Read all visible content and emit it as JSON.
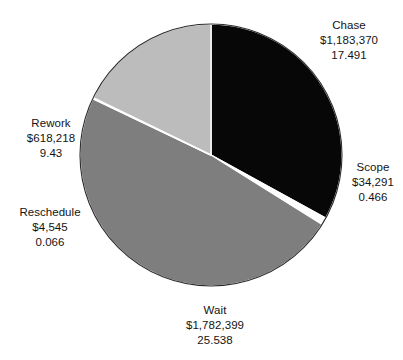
{
  "chart_data": {
    "type": "pie",
    "title": "",
    "subtitle": "",
    "xlabel": "",
    "ylabel": "",
    "legend_position": "none",
    "grid": false,
    "label_format": "name / currency amount / percent value",
    "start_angle_deg": 0,
    "direction": "clockwise",
    "center": {
      "x": 211,
      "y": 155
    },
    "radius": 131,
    "total_value": 3622823,
    "total_percent": 52.991,
    "categories": [
      "Chase",
      "Scope",
      "Wait",
      "Reschedule",
      "Rework"
    ],
    "values": [
      1183370,
      34291,
      1782399,
      4545,
      618218
    ],
    "percents": [
      17.491,
      0.466,
      25.538,
      0.066,
      9.43
    ],
    "slices": [
      {
        "name": "Chase",
        "value": 1183370,
        "value_text": "$1,183,370",
        "percent": 17.491,
        "percent_text": "17.491",
        "color": "#070707",
        "sweep_deg": 118.83,
        "start_deg": 0
      },
      {
        "name": "Scope",
        "value": 34291,
        "value_text": "$34,291",
        "percent": 0.466,
        "percent_text": "0.466",
        "color": "#fdfdfd",
        "sweep_deg": 3.17,
        "start_deg": 118.83
      },
      {
        "name": "Wait",
        "value": 1782399,
        "value_text": "$1,782,399",
        "percent": 25.538,
        "percent_text": "25.538",
        "color": "#7e7e7e",
        "sweep_deg": 173.48,
        "start_deg": 122.0
      },
      {
        "name": "Reschedule",
        "value": 4545,
        "value_text": "$4,545",
        "percent": 0.066,
        "percent_text": "0.066",
        "color": "#5e5e5e",
        "sweep_deg": 0.45,
        "start_deg": 295.48
      },
      {
        "name": "Rework",
        "value": 618218,
        "value_text": "$618,218",
        "percent": 9.43,
        "percent_text": "9.43",
        "color": "#bcbcbc",
        "sweep_deg": 64.07,
        "start_deg": 295.93
      }
    ],
    "colors": {
      "chase": "#070707",
      "scope": "#fdfdfd",
      "wait": "#7e7e7e",
      "reschedule": "#5e5e5e",
      "rework": "#bcbcbc",
      "outline": "#2b2b2b",
      "background": "#ffffff",
      "text": "#141414"
    }
  }
}
